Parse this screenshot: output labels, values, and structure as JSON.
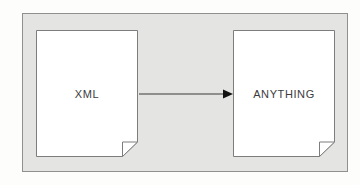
{
  "diagram": {
    "type": "flow",
    "container": {
      "fill": "#e4e4e2",
      "border_color": "#909090"
    },
    "nodes": [
      {
        "id": "xml",
        "shape": "document",
        "label": "XML"
      },
      {
        "id": "anything",
        "shape": "document",
        "label": "ANYTHING"
      }
    ],
    "edges": [
      {
        "from": "xml",
        "to": "anything",
        "style": "solid",
        "arrowhead": "filled-triangle"
      }
    ],
    "colors": {
      "page_background": "#fdfdfc",
      "node_fill": "#ffffff",
      "node_border": "#7d7d7d",
      "edge": "#3a3a3a",
      "arrowhead": "#121212",
      "text": "#3c3c3c"
    }
  }
}
